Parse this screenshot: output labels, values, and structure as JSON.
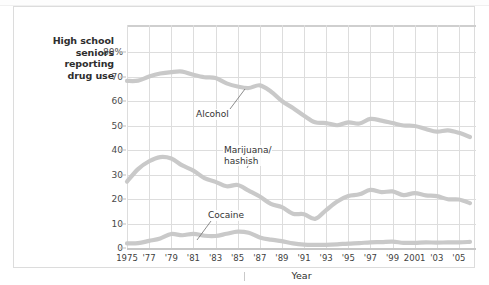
{
  "caption": "High school\nseniors\nreporting\ndrug use",
  "axis": {
    "y_title": "",
    "x_title": "Year",
    "y_ticks": [
      "80%",
      "70",
      "60",
      "50",
      "40",
      "30",
      "20",
      "10",
      "0"
    ],
    "x_ticks": [
      "1975",
      "'77",
      "'79",
      "'81",
      "'83",
      "'85",
      "'87",
      "'89",
      "'91",
      "'93",
      "'95",
      "'97",
      "'99",
      "2001",
      "'03",
      "'05"
    ]
  },
  "annotations": [
    {
      "name": "alcohol",
      "text": "Alcohol"
    },
    {
      "name": "marijuana",
      "text": "Marijuana/\nhashish"
    },
    {
      "name": "cocaine",
      "text": "Cocaine"
    }
  ],
  "colors": {
    "series_line": "#c9c9c9",
    "grid": "#dddddd",
    "card_border": "#dcdcdc",
    "text": "#2e2e2e",
    "background": "#ffffff"
  },
  "chart_data": {
    "type": "line",
    "title": "",
    "xlabel": "Year",
    "ylabel": "High school seniors reporting drug use",
    "xlim": [
      1975,
      2006
    ],
    "ylim": [
      0,
      85
    ],
    "yticks": [
      0,
      10,
      20,
      30,
      40,
      50,
      60,
      70,
      80
    ],
    "ytick_labels": [
      "0",
      "10",
      "20",
      "30",
      "40",
      "50",
      "60",
      "70",
      "80%"
    ],
    "grid": true,
    "legend": "inline-annotations",
    "x": [
      1975,
      1976,
      1977,
      1978,
      1979,
      1980,
      1981,
      1982,
      1983,
      1984,
      1985,
      1986,
      1987,
      1988,
      1989,
      1990,
      1991,
      1992,
      1993,
      1994,
      1995,
      1996,
      1997,
      1998,
      1999,
      2000,
      2001,
      2002,
      2003,
      2004,
      2005,
      2006
    ],
    "series": [
      {
        "name": "Alcohol",
        "values": [
          68.2,
          68.3,
          70.0,
          71.2,
          71.8,
          72.0,
          70.7,
          69.7,
          69.4,
          67.2,
          65.9,
          65.3,
          66.4,
          63.9,
          60.0,
          57.1,
          54.0,
          51.3,
          51.0,
          50.1,
          51.3,
          50.8,
          52.7,
          52.0,
          51.0,
          50.0,
          49.8,
          48.6,
          47.5,
          48.0,
          47.0,
          45.3
        ]
      },
      {
        "name": "Marijuana/hashish",
        "values": [
          27.1,
          32.2,
          35.4,
          37.1,
          36.5,
          33.7,
          31.6,
          28.5,
          27.0,
          25.2,
          25.7,
          23.4,
          21.0,
          18.0,
          16.7,
          14.0,
          13.8,
          11.9,
          15.5,
          19.0,
          21.2,
          21.9,
          23.7,
          22.8,
          23.1,
          21.6,
          22.4,
          21.5,
          21.2,
          19.9,
          19.8,
          18.3
        ]
      },
      {
        "name": "Cocaine",
        "values": [
          1.9,
          2.0,
          2.9,
          3.9,
          5.7,
          5.2,
          5.8,
          5.0,
          4.9,
          5.8,
          6.7,
          6.2,
          4.3,
          3.4,
          2.8,
          1.9,
          1.4,
          1.3,
          1.3,
          1.5,
          1.8,
          2.0,
          2.3,
          2.4,
          2.6,
          2.1,
          2.1,
          2.3,
          2.2,
          2.3,
          2.3,
          2.5
        ]
      }
    ]
  }
}
